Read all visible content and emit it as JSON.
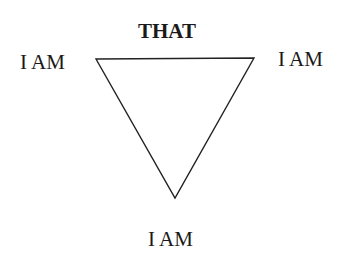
{
  "diagram": {
    "type": "inverted-triangle",
    "title": "THAT",
    "vertices": [
      {
        "position": "top-left",
        "label": "I AM"
      },
      {
        "position": "top-right",
        "label": "I AM"
      },
      {
        "position": "bottom",
        "label": "I AM"
      }
    ],
    "colors": {
      "line": "#222222",
      "text": "#1a1a1a",
      "background": "#ffffff"
    }
  }
}
